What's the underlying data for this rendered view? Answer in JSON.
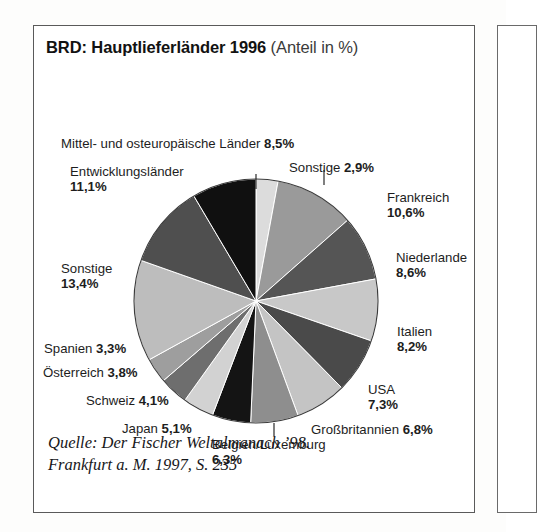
{
  "figure": {
    "title_bold": "BRD: Hauptlieferländer 1996",
    "title_regular": "(Anteil in %)",
    "source_line1": "Quelle: Der Fischer Weltalmanach ’98.",
    "source_line2": "Frankfurt a. M. 1997, S. 235"
  },
  "labels": {
    "mittel_ost": {
      "name": "Mittel- und osteuropäische Länder",
      "value": "8,5%"
    },
    "sonstige_top": {
      "name": "Sonstige",
      "value": "2,9%"
    },
    "entwicklung": {
      "name": "Entwicklungsländer",
      "value": "11,1%"
    },
    "frankreich": {
      "name": "Frankreich",
      "value": "10,6%"
    },
    "niederlande": {
      "name": "Niederlande",
      "value": "8,6%"
    },
    "italien": {
      "name": "Italien",
      "value": "8,2%"
    },
    "usa": {
      "name": "USA",
      "value": "7,3%"
    },
    "grossbritannien": {
      "name": "Großbritannien",
      "value": "6,8%"
    },
    "belgien": {
      "name": "Belgien/Luxemburg",
      "value": "6,3%"
    },
    "japan": {
      "name": "Japan",
      "value": "5,1%"
    },
    "schweiz": {
      "name": "Schweiz",
      "value": "4,1%"
    },
    "oesterreich": {
      "name": "Österreich",
      "value": "3,8%"
    },
    "spanien": {
      "name": "Spanien",
      "value": "3,3%"
    },
    "sonstige_left": {
      "name": "Sonstige",
      "value": "13,4%"
    }
  },
  "chart_data": {
    "type": "pie",
    "title": "BRD: Hauptlieferländer 1996 (Anteil in %)",
    "unit": "%",
    "start_angle_deg": 0,
    "direction": "clockwise",
    "total": 100.0,
    "labels": [
      "Sonstige",
      "Frankreich",
      "Niederlande",
      "Italien",
      "USA",
      "Großbritannien",
      "Belgien/Luxemburg",
      "Japan",
      "Schweiz",
      "Österreich",
      "Spanien",
      "Sonstige",
      "Entwicklungsländer",
      "Mittel- und osteuropäische Länder"
    ],
    "values": [
      2.9,
      10.6,
      8.6,
      8.2,
      7.3,
      6.8,
      6.3,
      5.1,
      4.1,
      3.8,
      3.3,
      13.4,
      11.1,
      8.5
    ],
    "value_labels": [
      "2,9%",
      "10,6%",
      "8,6%",
      "8,2%",
      "7,3%",
      "6,8%",
      "6,3%",
      "5,1%",
      "4,1%",
      "3,8%",
      "3,3%",
      "13,4%",
      "11,1%",
      "8,5%"
    ],
    "colors": [
      "#dcdcdc",
      "#9a9a9a",
      "#555555",
      "#c8c8c8",
      "#4a4a4a",
      "#c4c4c4",
      "#8e8e8e",
      "#141414",
      "#d2d2d2",
      "#6e6e6e",
      "#9e9e9e",
      "#bdbdbd",
      "#4f4f4f",
      "#101010"
    ],
    "legend": "none",
    "grid": false,
    "source": "Quelle: Der Fischer Weltalmanach ’98. Frankfurt a. M. 1997, S. 235"
  }
}
